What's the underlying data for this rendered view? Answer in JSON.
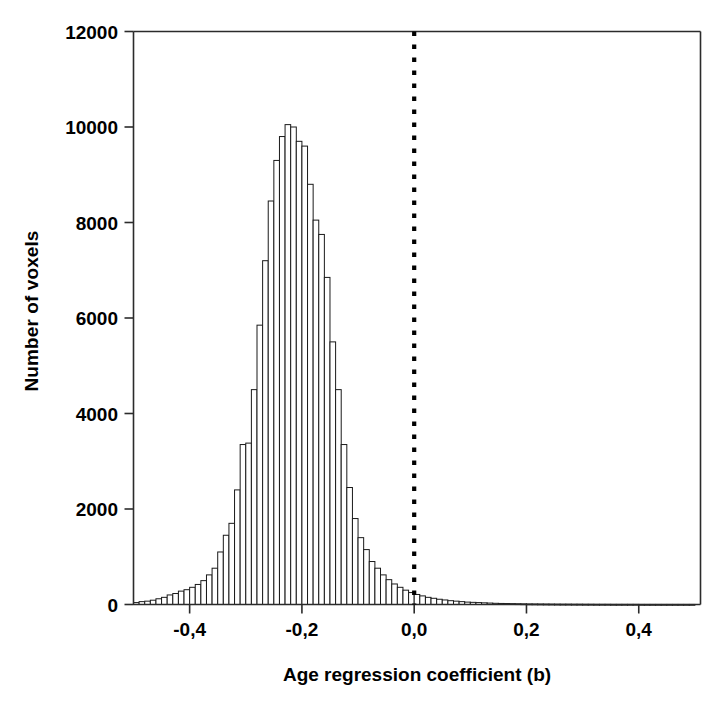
{
  "chart_data": {
    "type": "bar",
    "title": "",
    "xlabel": "Age regression coefficient (b)",
    "ylabel": "Number of voxels",
    "xlim": [
      -0.5,
      0.51
    ],
    "ylim": [
      0,
      12000
    ],
    "grid": false,
    "legend": null,
    "xtick_labels": [
      "-0,4",
      "-0,2",
      "0,0",
      "0,2",
      "0,4"
    ],
    "xtick_values": [
      -0.4,
      -0.2,
      0.0,
      0.2,
      0.4
    ],
    "ytick_labels": [
      "0",
      "2000",
      "4000",
      "6000",
      "8000",
      "10000",
      "12000"
    ],
    "ytick_values": [
      0,
      2000,
      4000,
      6000,
      8000,
      10000,
      12000
    ],
    "bin_width": 0.01,
    "bar_style": "open-outline",
    "annotations": [
      {
        "name": "zero-reference-line",
        "type": "vertical-dotted-line",
        "x": 0.0,
        "y_from": 0,
        "y_to": 12000,
        "color": "#000000"
      }
    ],
    "categories": [
      -0.495,
      -0.485,
      -0.475,
      -0.465,
      -0.455,
      -0.445,
      -0.435,
      -0.425,
      -0.415,
      -0.405,
      -0.395,
      -0.385,
      -0.375,
      -0.365,
      -0.355,
      -0.345,
      -0.335,
      -0.325,
      -0.315,
      -0.305,
      -0.295,
      -0.285,
      -0.275,
      -0.265,
      -0.255,
      -0.245,
      -0.235,
      -0.225,
      -0.215,
      -0.205,
      -0.195,
      -0.185,
      -0.175,
      -0.165,
      -0.155,
      -0.145,
      -0.135,
      -0.125,
      -0.115,
      -0.105,
      -0.095,
      -0.085,
      -0.075,
      -0.065,
      -0.055,
      -0.045,
      -0.035,
      -0.025,
      -0.015,
      -0.005,
      0.005,
      0.015,
      0.025,
      0.035,
      0.045,
      0.055,
      0.065,
      0.075,
      0.085,
      0.095,
      0.105,
      0.115,
      0.125,
      0.135,
      0.145,
      0.155,
      0.165,
      0.175,
      0.185,
      0.195,
      0.205,
      0.215,
      0.225,
      0.235,
      0.245,
      0.255,
      0.265,
      0.275,
      0.285,
      0.295,
      0.305,
      0.315,
      0.325,
      0.335,
      0.345,
      0.355,
      0.365,
      0.375,
      0.385,
      0.395,
      0.405,
      0.415,
      0.425,
      0.435,
      0.445,
      0.455,
      0.465,
      0.475,
      0.485,
      0.495
    ],
    "values": [
      40,
      60,
      70,
      90,
      120,
      150,
      200,
      230,
      280,
      310,
      360,
      420,
      500,
      620,
      760,
      1100,
      1450,
      1700,
      2400,
      3350,
      3380,
      4500,
      5850,
      7200,
      8450,
      9300,
      9800,
      10050,
      10000,
      9700,
      9600,
      8800,
      8050,
      7750,
      6850,
      5500,
      4500,
      3350,
      2450,
      1800,
      1400,
      1150,
      900,
      760,
      620,
      520,
      430,
      360,
      300,
      250,
      210,
      180,
      150,
      130,
      110,
      95,
      80,
      70,
      60,
      50,
      45,
      40,
      35,
      30,
      25,
      22,
      20,
      18,
      16,
      14,
      12,
      11,
      10,
      9,
      8,
      7,
      6,
      6,
      5,
      5,
      4,
      4,
      3,
      3,
      3,
      2,
      2,
      2,
      2,
      2,
      1,
      1,
      1,
      1,
      1,
      1,
      1,
      1,
      1,
      1
    ]
  },
  "bars": [
    {
      "x": -0.49,
      "v": 40
    },
    {
      "x": -0.48,
      "v": 55
    },
    {
      "x": -0.47,
      "v": 70
    },
    {
      "x": -0.46,
      "v": 95
    },
    {
      "x": -0.45,
      "v": 120
    },
    {
      "x": -0.44,
      "v": 170
    },
    {
      "x": -0.43,
      "v": 200
    },
    {
      "x": -0.42,
      "v": 250
    },
    {
      "x": -0.41,
      "v": 300
    },
    {
      "x": -0.4,
      "v": 330
    },
    {
      "x": -0.39,
      "v": 380
    },
    {
      "x": -0.38,
      "v": 450
    },
    {
      "x": -0.37,
      "v": 540
    },
    {
      "x": -0.36,
      "v": 700
    },
    {
      "x": -0.35,
      "v": 780
    },
    {
      "x": -0.34,
      "v": 1100
    },
    {
      "x": -0.33,
      "v": 1450
    },
    {
      "x": -0.32,
      "v": 1700
    },
    {
      "x": -0.31,
      "v": 2400
    },
    {
      "x": -0.3,
      "v": 3350
    },
    {
      "x": -0.29,
      "v": 3380
    },
    {
      "x": -0.28,
      "v": 4500
    },
    {
      "x": -0.27,
      "v": 5850
    },
    {
      "x": -0.26,
      "v": 7200
    },
    {
      "x": -0.25,
      "v": 8450
    },
    {
      "x": -0.24,
      "v": 9300
    },
    {
      "x": -0.23,
      "v": 9800
    },
    {
      "x": -0.22,
      "v": 10050
    },
    {
      "x": -0.21,
      "v": 10000
    },
    {
      "x": -0.2,
      "v": 9700
    },
    {
      "x": -0.19,
      "v": 9600
    },
    {
      "x": -0.18,
      "v": 8800
    },
    {
      "x": -0.17,
      "v": 8050
    },
    {
      "x": -0.16,
      "v": 7750
    },
    {
      "x": -0.15,
      "v": 6850
    },
    {
      "x": -0.14,
      "v": 5500
    },
    {
      "x": -0.13,
      "v": 4500
    },
    {
      "x": -0.12,
      "v": 3350
    },
    {
      "x": -0.11,
      "v": 2450
    },
    {
      "x": -0.1,
      "v": 1800
    },
    {
      "x": -0.09,
      "v": 1400
    },
    {
      "x": -0.08,
      "v": 1150
    },
    {
      "x": -0.07,
      "v": 900
    },
    {
      "x": -0.06,
      "v": 760
    },
    {
      "x": -0.05,
      "v": 620
    },
    {
      "x": -0.04,
      "v": 520
    },
    {
      "x": -0.03,
      "v": 430
    },
    {
      "x": -0.02,
      "v": 360
    },
    {
      "x": -0.01,
      "v": 300
    },
    {
      "x": 0.0,
      "v": 250
    }
  ]
}
